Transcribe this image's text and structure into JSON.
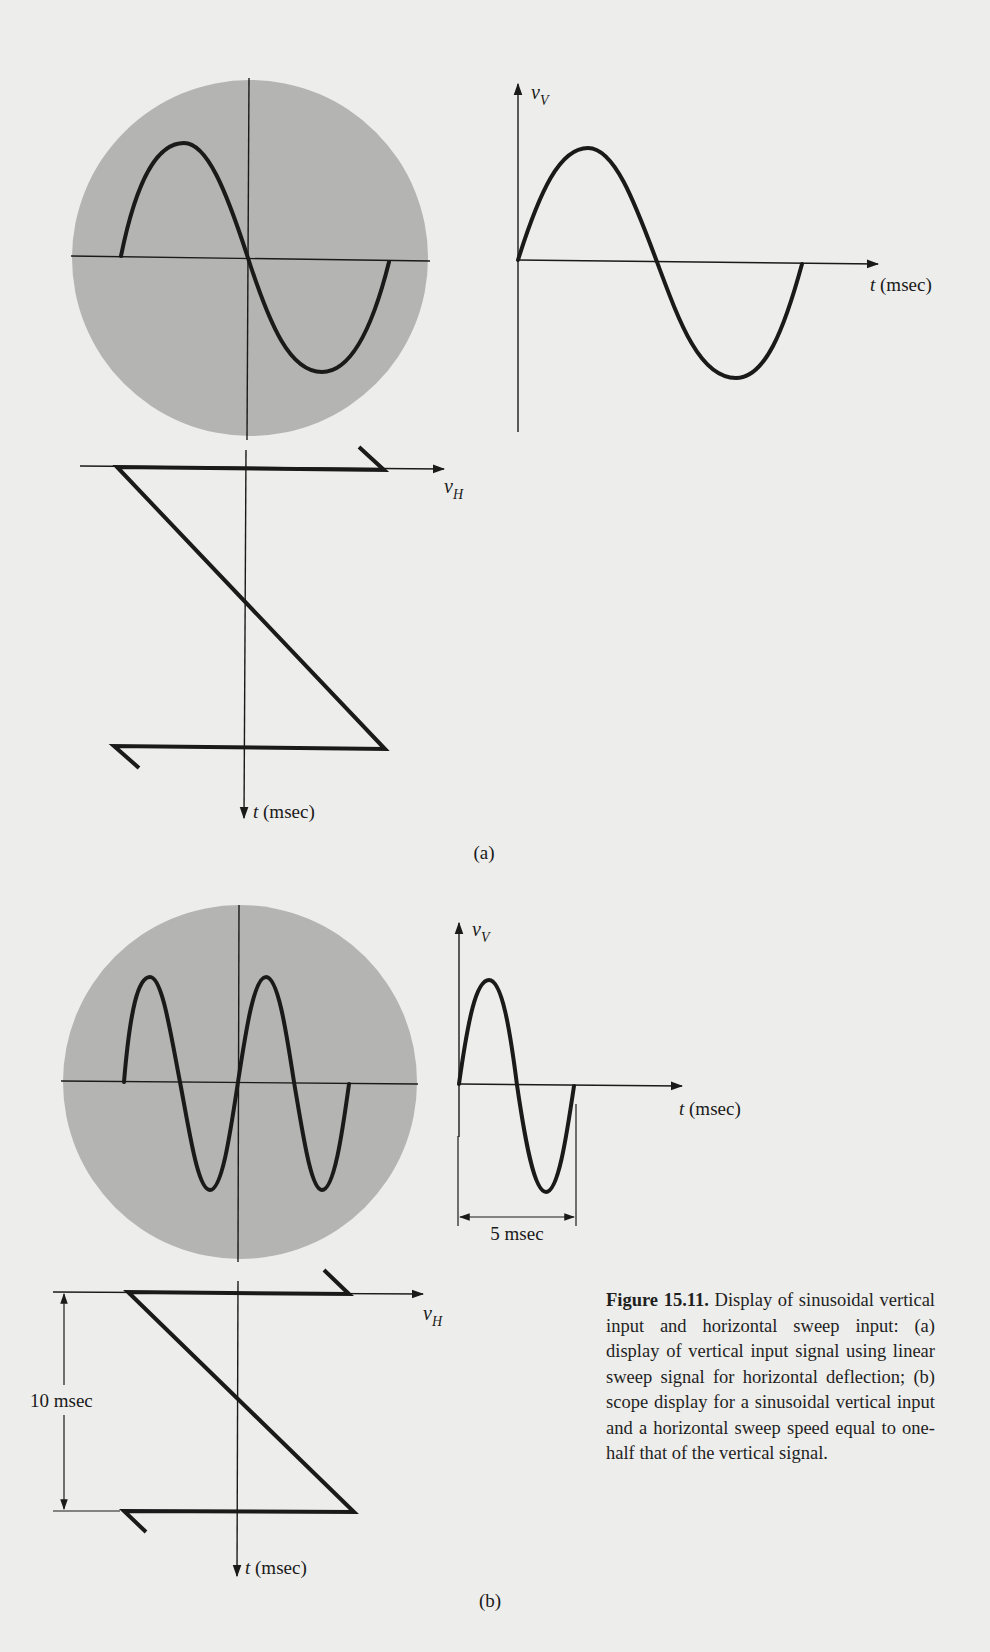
{
  "figure": {
    "number": "Figure 15.11.",
    "caption_text": "Display of sinusoidal vertical input and horizontal sweep input: (a) display of vertical input signal using linear sweep signal for horizontal deflection; (b) scope display for a sinusoidal vertical input and a horizontal sweep speed equal to one-half that of the vertical signal."
  },
  "panel_a": {
    "label": "(a)",
    "screen": {
      "trace": "one full sine cycle",
      "cycles": 1
    },
    "vertical_plot": {
      "y_axis_label_main": "v",
      "y_axis_label_sub": "V",
      "x_axis_label_var": "t",
      "x_axis_label_unit": "(msec)",
      "cycles": 1
    },
    "sweep_plot": {
      "h_axis_label_main": "v",
      "h_axis_label_sub": "H",
      "t_axis_label_var": "t",
      "t_axis_label_unit": "(msec)"
    }
  },
  "panel_b": {
    "label": "(b)",
    "screen": {
      "trace": "two full sine cycles",
      "cycles": 2
    },
    "vertical_plot": {
      "y_axis_label_main": "v",
      "y_axis_label_sub": "V",
      "x_axis_label_var": "t",
      "x_axis_label_unit": "(msec)",
      "period_label": "5 msec",
      "cycles": 1
    },
    "sweep_plot": {
      "h_axis_label_main": "v",
      "h_axis_label_sub": "H",
      "t_axis_label_var": "t",
      "t_axis_label_unit": "(msec)",
      "sweep_period_label": "10 msec"
    }
  },
  "colors": {
    "page_background": "#ededeb",
    "screen_fill": "#b4b4b2",
    "trace": "#1a1a1a"
  }
}
